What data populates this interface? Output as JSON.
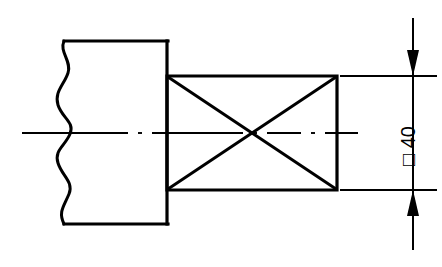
{
  "drawing": {
    "title": "Square shaft end – sectional detail",
    "type": "mechanical-engineering-drawing",
    "background_color": "#ffffff",
    "line_color": "#000000",
    "dimension": {
      "label": "□ 40",
      "symbol": "square-section-symbol",
      "value": "40",
      "unit": "mm",
      "orientation": "vertical",
      "text_rotation_degrees": -90,
      "arrow_direction": "inward",
      "arrow_count": 2
    },
    "features": [
      {
        "name": "shaft-body",
        "description": "Cylindrical shaft body shown partially with freehand break on left",
        "outline": "rectangle-with-wavy-break"
      },
      {
        "name": "square-section",
        "description": "Square cross-section end of shaft indicated by crossed diagonals",
        "outline": "rectangle-with-diagonals"
      },
      {
        "name": "center-line",
        "description": "Horizontal axis centre line through the shaft",
        "pattern": "dash-dot"
      },
      {
        "name": "break-line",
        "description": "Freehand wavy break line at left end of shaft",
        "pattern": "freehand-wavy"
      },
      {
        "name": "extension-lines",
        "description": "Two horizontal extension lines projecting from square section top and bottom edges",
        "count": 2
      },
      {
        "name": "dimension-line",
        "description": "Vertical dimension line with arrowheads pointing inward toward the extension lines",
        "count": 1
      }
    ]
  }
}
